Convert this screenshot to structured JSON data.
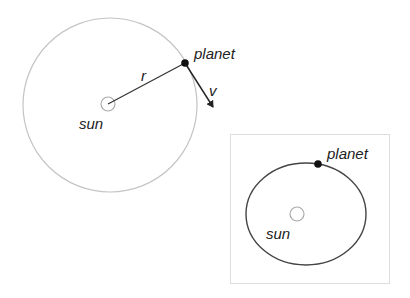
{
  "diagram": {
    "circular_orbit": {
      "sun_label": "sun",
      "planet_label": "planet",
      "radius_label": "r",
      "velocity_label": "v",
      "orbit_color": "#bbbbbb",
      "vector_color": "#222222"
    },
    "elliptical_orbit": {
      "sun_label": "sun",
      "planet_label": "planet",
      "orbit_color": "#444444",
      "frame_color": "#dddddd"
    }
  }
}
